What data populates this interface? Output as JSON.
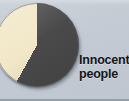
{
  "figure": {
    "background_color": "#c5cbd4",
    "label_color": "#14161a"
  },
  "legend": {
    "line1": "Innocent",
    "line2": "people"
  },
  "chart_data": {
    "type": "pie",
    "title": "",
    "subtitle": "",
    "xlabel": "",
    "ylabel": "",
    "grid": false,
    "legend_position": "right",
    "annotations": [
      "Innocent people"
    ],
    "categories": [
      "Innocent people",
      "Other"
    ],
    "values": [
      58,
      42
    ],
    "labels": [
      "Innocent people",
      ""
    ],
    "colors": [
      "#4a4a4a",
      "#f2e8c8"
    ],
    "start_angle_deg": 0,
    "direction": "clockwise",
    "slices": [
      {
        "name": "Innocent people",
        "value": 58,
        "color": "#4a4a4a",
        "start_angle_deg": 0,
        "end_angle_deg": 209,
        "labeled": true,
        "label": "Innocent people"
      },
      {
        "name": "Other",
        "value": 42,
        "color": "#f2e8c8",
        "start_angle_deg": 209,
        "end_angle_deg": 360,
        "labeled": false,
        "label": ""
      }
    ]
  }
}
